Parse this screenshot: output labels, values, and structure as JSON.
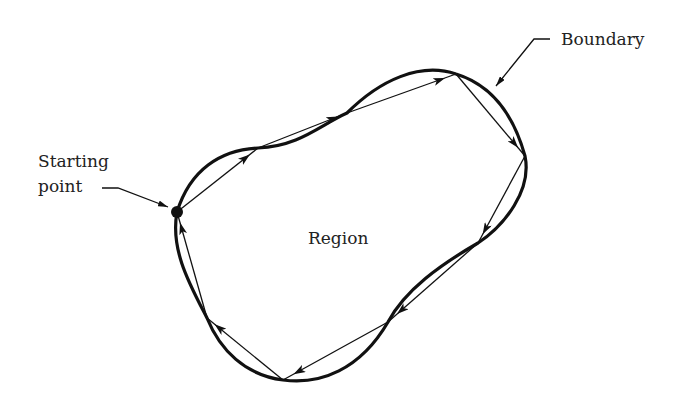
{
  "diagram": {
    "type": "boundary-tracing",
    "labels": {
      "starting_point": [
        "Starting",
        "point"
      ],
      "boundary": "Boundary",
      "region": "Region"
    },
    "polygon_segments": 9,
    "direction": "clockwise",
    "colors": {
      "ink": "#111111",
      "background": "#ffffff"
    }
  }
}
